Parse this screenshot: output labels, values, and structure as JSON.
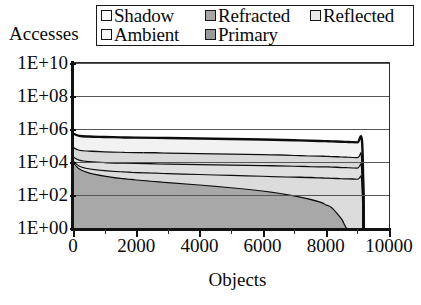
{
  "chart_data": {
    "type": "area",
    "stacked": true,
    "title": "",
    "xlabel": "Objects",
    "ylabel": "Accesses",
    "xlim": [
      0,
      10000
    ],
    "ylim": [
      1,
      10000000000
    ],
    "yscale": "log",
    "grid": true,
    "legend_position": "top",
    "x_ticks": [
      "0",
      "2000",
      "4000",
      "6000",
      "8000",
      "10000"
    ],
    "x_tick_values": [
      0,
      2000,
      4000,
      6000,
      8000,
      10000
    ],
    "x_minor_tick_values": [
      1000,
      3000,
      5000,
      7000,
      9000
    ],
    "y_ticks": [
      "1E+00",
      "1E+02",
      "1E+04",
      "1E+06",
      "1E+08",
      "1E+10"
    ],
    "y_tick_values": [
      1,
      100,
      10000,
      1000000,
      100000000,
      10000000000
    ],
    "data_x_extent": [
      0,
      9200
    ],
    "series": [
      {
        "name": "Shadow",
        "color": "#f2f2f2",
        "x": [
          0,
          200,
          500,
          1000,
          1500,
          2000,
          3000,
          4000,
          5000,
          6000,
          7000,
          8000,
          8600,
          9000,
          9150,
          9200
        ],
        "values": [
          450000,
          330000,
          300000,
          285000,
          270000,
          260000,
          245000,
          230000,
          215000,
          200000,
          180000,
          160000,
          145000,
          135000,
          130000,
          0
        ]
      },
      {
        "name": "Refracted",
        "color": "#d9d9d9",
        "x": [
          0,
          200,
          500,
          1000,
          1500,
          2000,
          3000,
          4000,
          5000,
          6000,
          7000,
          8000,
          8600,
          9000,
          9150,
          9200
        ],
        "values": [
          60000,
          42000,
          38000,
          35000,
          33000,
          31500,
          29500,
          27500,
          25500,
          23500,
          21000,
          18500,
          16500,
          15500,
          15000,
          0
        ]
      },
      {
        "name": "Reflected",
        "color": "#e0e0e0",
        "x": [
          0,
          200,
          500,
          1000,
          1500,
          2000,
          3000,
          4000,
          5000,
          6000,
          7000,
          8000,
          8600,
          9000,
          9150,
          9200
        ],
        "values": [
          9500,
          7800,
          7200,
          6800,
          6500,
          6300,
          6000,
          5700,
          5400,
          5100,
          4700,
          4300,
          3900,
          3700,
          3600,
          0
        ]
      },
      {
        "name": "Ambient",
        "color": "#dcdcdc",
        "x": [
          0,
          200,
          500,
          1000,
          1500,
          2000,
          3000,
          4000,
          5000,
          6000,
          7000,
          8000,
          8600,
          9000,
          9150,
          9200
        ],
        "values": [
          2400,
          2000,
          1850,
          1750,
          1680,
          1620,
          1540,
          1460,
          1380,
          1300,
          1210,
          1120,
          1030,
          980,
          950,
          0
        ]
      },
      {
        "name": "Primary",
        "color": "#a8a8a8",
        "x": [
          0,
          200,
          500,
          1000,
          1500,
          2000,
          3000,
          4000,
          5000,
          6000,
          7000,
          7800,
          8200,
          8500,
          8650,
          8700
        ],
        "values": [
          11000,
          4200,
          2400,
          1500,
          1100,
          880,
          620,
          440,
          300,
          190,
          95,
          42,
          18,
          4,
          1.2,
          1
        ]
      }
    ],
    "legend_entries": [
      {
        "label": "Shadow",
        "swatch": "#ffffff"
      },
      {
        "label": "Refracted",
        "swatch": "#a6a6a6"
      },
      {
        "label": "Reflected",
        "swatch": "#e8e8e8"
      },
      {
        "label": "Ambient",
        "swatch": "#fbfbfb"
      },
      {
        "label": "Primary",
        "swatch": "#9a9a9a"
      }
    ]
  }
}
